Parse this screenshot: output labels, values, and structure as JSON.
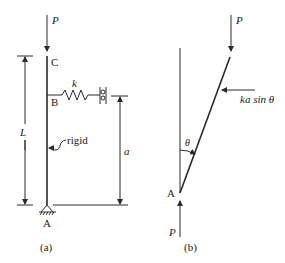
{
  "figure_a": {
    "caption": "(a)",
    "load_label": "P",
    "top_point": "C",
    "spring_point": "B",
    "base_point": "A",
    "spring_label": "k",
    "length_label": "L",
    "spring_height_label": "a",
    "member_note": "rigid"
  },
  "figure_b": {
    "caption": "(b)",
    "top_load_label": "P",
    "bottom_load_label": "P",
    "pivot_point": "A",
    "angle_label": "θ",
    "spring_force_label": "ka sin θ"
  }
}
